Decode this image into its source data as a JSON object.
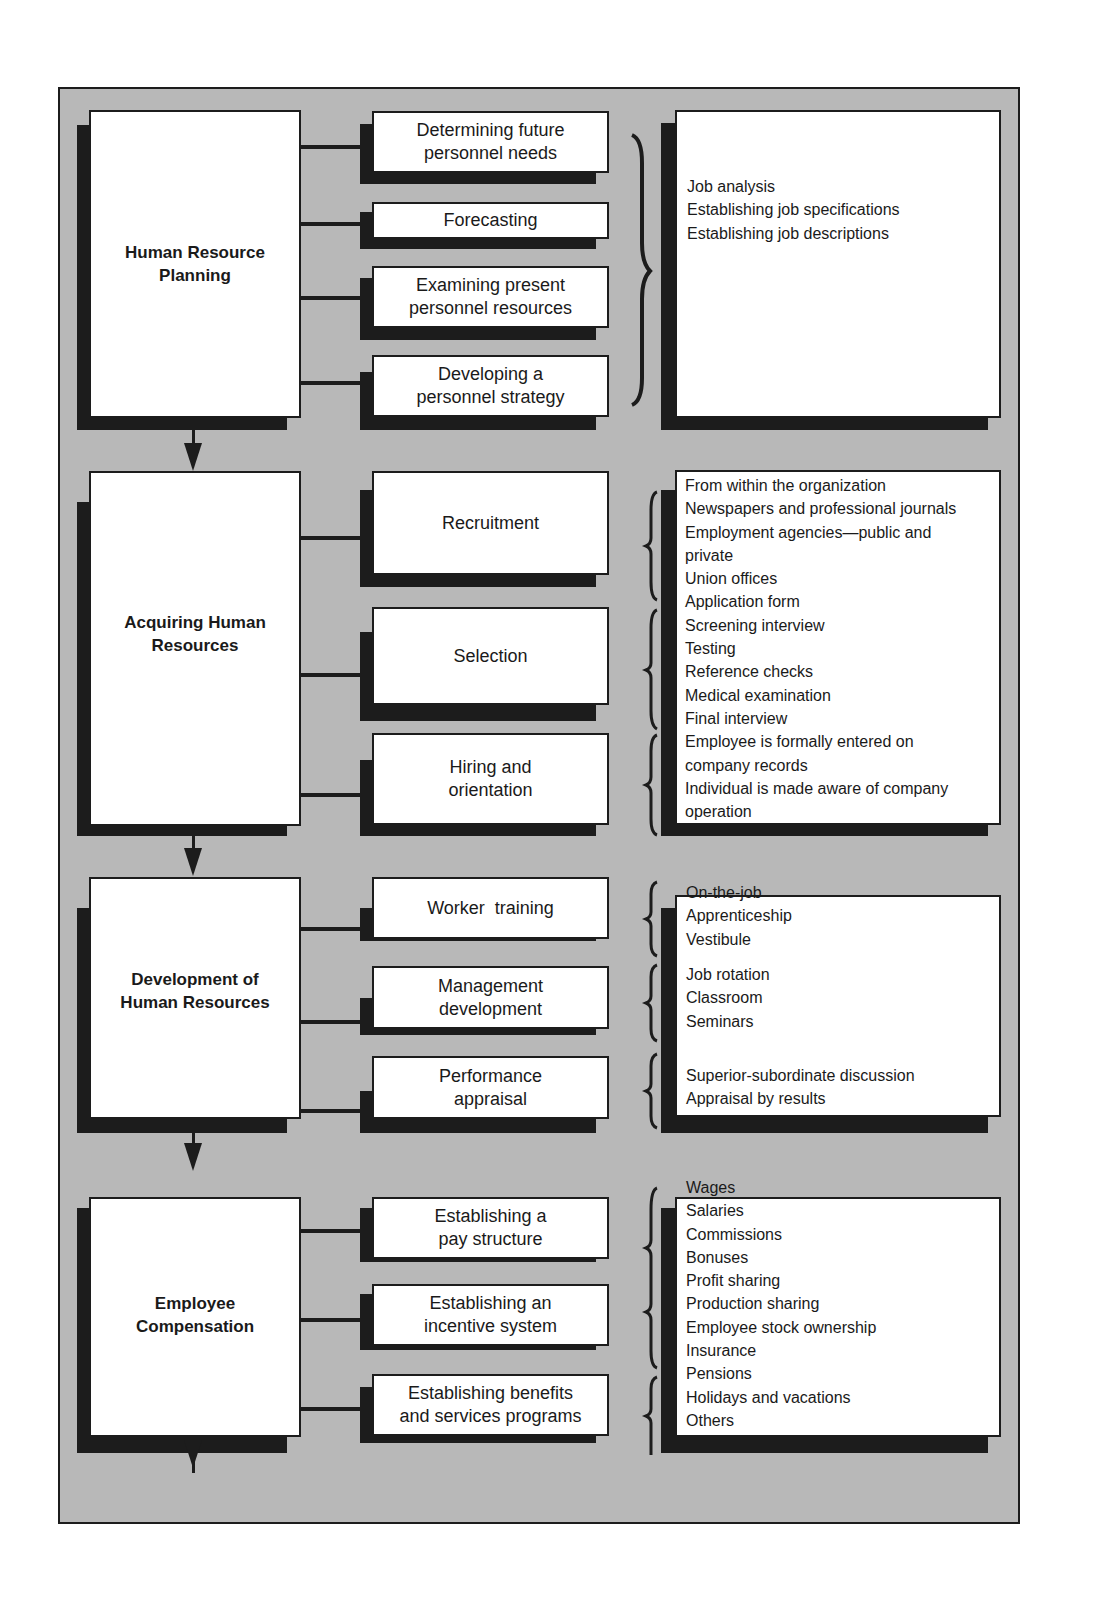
{
  "diagram": {
    "type": "process flow / hierarchy",
    "sections": [
      {
        "title": "Human Resource\nPlanning",
        "activities": [
          "Determining future\npersonnel needs",
          "Forecasting",
          "Examining present\npersonnel resources",
          "Developing a\npersonnel strategy"
        ],
        "details": [
          "Job analysis",
          "Establishing job specifications",
          "Establishing job descriptions"
        ]
      },
      {
        "title": "Acquiring Human\nResources",
        "activities": [
          "Recruitment",
          "Selection",
          "Hiring and\norientation"
        ],
        "details": [
          "From within the organization",
          "Newspapers and professional journals",
          "Employment agencies—public and",
          "private",
          "Union offices",
          "Application form",
          "Screening interview",
          "Testing",
          "Reference checks",
          "Medical examination",
          "Final interview",
          "Employee is formally entered on",
          "company records",
          "Individual is made aware of company",
          "operation"
        ]
      },
      {
        "title": "Development of\nHuman Resources",
        "activities": [
          "Worker  training",
          "Management\ndevelopment",
          "Performance\nappraisal"
        ],
        "details_groups": [
          [
            "On-the-job",
            "Apprenticeship",
            "Vestibule"
          ],
          [
            "Job rotation",
            "Classroom",
            "Seminars"
          ],
          [
            "Superior-subordinate discussion",
            "Appraisal by results"
          ]
        ]
      },
      {
        "title": "Employee\nCompensation",
        "activities": [
          "Establishing a\npay structure",
          "Establishing an\nincentive system",
          "Establishing benefits\nand services programs"
        ],
        "details": [
          "Wages",
          "Salaries",
          "Commissions",
          "Bonuses",
          "Profit sharing",
          "Production sharing",
          "Employee stock ownership",
          "Insurance",
          "Pensions",
          "Holidays and vacations",
          "Others"
        ]
      }
    ],
    "colors": {
      "background": "#b8b8b8",
      "box": "#ffffff",
      "shadow_and_lines": "#1c1c1c"
    }
  }
}
